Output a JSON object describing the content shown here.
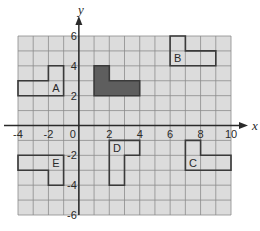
{
  "diagram": {
    "type": "coordinate-grid-transformations",
    "x_axis": {
      "label": "x",
      "min": -4,
      "max": 10,
      "ticks": [
        "-4",
        "-2",
        "0",
        "2",
        "4",
        "6",
        "8",
        "10"
      ]
    },
    "y_axis": {
      "label": "y",
      "min": -6,
      "max": 6,
      "ticks": [
        "6",
        "4",
        "2",
        "-2",
        "-4",
        "-6"
      ]
    },
    "colors": {
      "grid_fill": "#dcdcdc",
      "grid_line": "#8c8c8c",
      "axis": "#2a2a2a",
      "shape_outline": "#3a3a3a",
      "shaded_fill": "#5e5e5e"
    },
    "shapes": [
      {
        "label": "",
        "shaded": true,
        "points": [
          [
            1,
            2
          ],
          [
            4,
            2
          ],
          [
            4,
            3
          ],
          [
            2,
            3
          ],
          [
            2,
            4
          ],
          [
            1,
            4
          ]
        ]
      },
      {
        "label": "A",
        "shaded": false,
        "label_at": [
          -1.5,
          2.5
        ],
        "points": [
          [
            -4,
            2
          ],
          [
            -1,
            2
          ],
          [
            -1,
            4
          ],
          [
            -2,
            4
          ],
          [
            -2,
            3
          ],
          [
            -4,
            3
          ]
        ]
      },
      {
        "label": "B",
        "shaded": false,
        "label_at": [
          6.5,
          4.5
        ],
        "points": [
          [
            6,
            4
          ],
          [
            9,
            4
          ],
          [
            9,
            5
          ],
          [
            7,
            5
          ],
          [
            7,
            6
          ],
          [
            6,
            6
          ]
        ]
      },
      {
        "label": "C",
        "shaded": false,
        "label_at": [
          7.5,
          -2.5
        ],
        "points": [
          [
            7,
            -1
          ],
          [
            8,
            -1
          ],
          [
            8,
            -2
          ],
          [
            10,
            -2
          ],
          [
            10,
            -3
          ],
          [
            7,
            -3
          ]
        ]
      },
      {
        "label": "D",
        "shaded": false,
        "label_at": [
          2.5,
          -1.5
        ],
        "points": [
          [
            2,
            -1
          ],
          [
            4,
            -1
          ],
          [
            4,
            -2
          ],
          [
            3,
            -2
          ],
          [
            3,
            -4
          ],
          [
            2,
            -4
          ]
        ]
      },
      {
        "label": "E",
        "shaded": false,
        "label_at": [
          -1.5,
          -2.5
        ],
        "points": [
          [
            -4,
            -2
          ],
          [
            -1,
            -2
          ],
          [
            -1,
            -4
          ],
          [
            -2,
            -4
          ],
          [
            -2,
            -3
          ],
          [
            -4,
            -3
          ]
        ]
      }
    ]
  }
}
